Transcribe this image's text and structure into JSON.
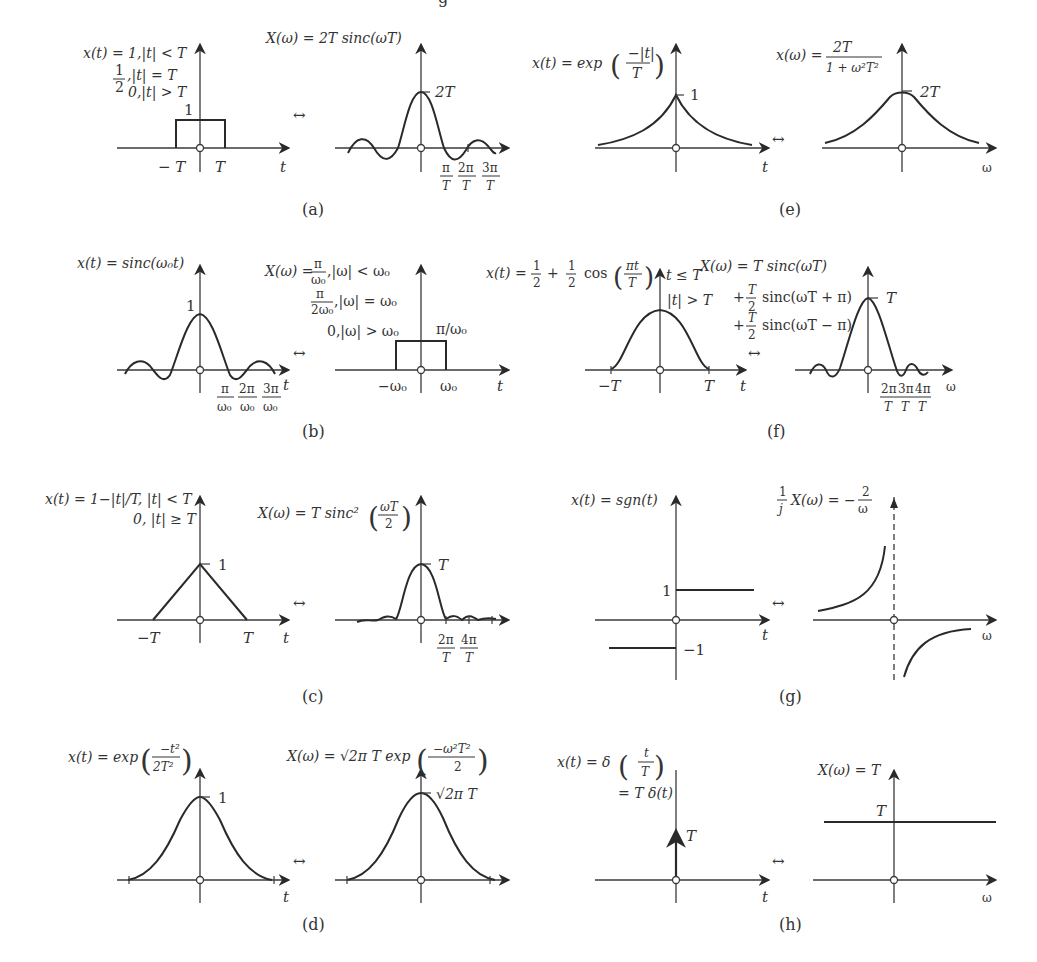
{
  "figure": {
    "cut_off_top_text": "g",
    "pair_symbol": "↔",
    "panels": {
      "a": {
        "caption": "(a)",
        "time": {
          "eq1": "x(t) = 1,|t| < T",
          "eq2_frac_num": "1",
          "eq2_frac_den": "2",
          "eq2": ",|t| = T",
          "eq3": "0,|t| > T",
          "height_label": "1",
          "ticks": [
            "− T",
            "T"
          ],
          "axis_label": "t"
        },
        "freq": {
          "eq1": "X(ω) = 2T sinc(ωT)",
          "peak_label": "2T",
          "ticks": [
            {
              "num": "π",
              "den": "T"
            },
            {
              "num": "2π",
              "den": "T"
            },
            {
              "num": "3π",
              "den": "T"
            }
          ]
        }
      },
      "b": {
        "caption": "(b)",
        "time": {
          "eq1": "x(t) = sinc(ω₀t)",
          "peak_label": "1",
          "ticks": [
            {
              "num": "π",
              "den": "ω₀"
            },
            {
              "num": "2π",
              "den": "ω₀"
            },
            {
              "num": "3π",
              "den": "ω₀"
            }
          ],
          "axis_label": "t"
        },
        "freq": {
          "eq1_prefix": "X(ω) =",
          "eq1_num": "π",
          "eq1_den": "ω₀",
          "eq1_suffix": ",|ω| < ω₀",
          "eq2_num": "π",
          "eq2_den": "2ω₀",
          "eq2_suffix": ",|ω| = ω₀",
          "eq3": "0,|ω| > ω₀",
          "height_label": "π/ω₀",
          "ticks": [
            "−ω₀",
            "ω₀"
          ],
          "axis_label": "t"
        }
      },
      "c": {
        "caption": "(c)",
        "time": {
          "eq1": "x(t) = 1−|t|/T, |t| < T",
          "eq2": "0, |t| ≥ T",
          "peak_label": "1",
          "ticks": [
            "−T",
            "T"
          ],
          "axis_label": "t"
        },
        "freq": {
          "eq1_prefix": "X(ω) = T sinc²",
          "eq1_num": "ωT",
          "eq1_den": "2",
          "peak_label": "T",
          "ticks": [
            {
              "num": "2π",
              "den": "T"
            },
            {
              "num": "4π",
              "den": "T"
            }
          ]
        }
      },
      "d": {
        "caption": "(d)",
        "time": {
          "eq1_prefix": "x(t) = exp",
          "eq1_num": "−t²",
          "eq1_den": "2T²",
          "peak_label": "1",
          "axis_label": "t"
        },
        "freq": {
          "eq1_prefix": "X(ω) = √2π T exp",
          "eq1_num": "−ω²T²",
          "eq1_den": "2",
          "peak_label": "√2π T"
        }
      },
      "e": {
        "caption": "(e)",
        "time": {
          "eq1_prefix": "x(t) = exp",
          "eq1_num": "−|t|",
          "eq1_den": "T",
          "peak_label": "1",
          "axis_label": "t"
        },
        "freq": {
          "eq1_prefix": "x(ω) =",
          "eq1_num": "2T",
          "eq1_den": "1 + ω²T²",
          "peak_label": "2T",
          "axis_label": "ω"
        }
      },
      "f": {
        "caption": "(f)",
        "time": {
          "eq1_prefix": "x(t) =",
          "eq1_a_num": "1",
          "eq1_a_den": "2",
          "eq1_plus": "+",
          "eq1_b_num": "1",
          "eq1_b_den": "2",
          "eq1_cos": "cos",
          "eq1_c_num": "πt",
          "eq1_c_den": "T",
          "cond1": "t ≤ T",
          "cond2": "|t| > T",
          "ticks": [
            "−T",
            "T"
          ],
          "axis_label": "t"
        },
        "freq": {
          "eq1": "X(ω) = T sinc(ωT)",
          "eq2_plus": "+",
          "eq2_num": "T",
          "eq2_den": "2",
          "eq2": "sinc(ωT + π)",
          "eq3_plus": "+",
          "eq3_num": "T",
          "eq3_den": "2",
          "eq3": "sinc(ωT − π)",
          "peak_label": "T",
          "ticks": [
            {
              "num": "2π",
              "den": "T"
            },
            {
              "num": "3π",
              "den": "T"
            },
            {
              "num": "4π",
              "den": "T"
            }
          ],
          "axis_label": "ω"
        }
      },
      "g": {
        "caption": "(g)",
        "time": {
          "eq1": "x(t) = sgn(t)",
          "pos_label": "1",
          "neg_label": "−1",
          "axis_label": "t"
        },
        "freq": {
          "eq1_a_num": "1",
          "eq1_a_den": "j",
          "eq1_mid": "X(ω) = −",
          "eq1_b_num": "2",
          "eq1_b_den": "ω",
          "axis_label": "ω"
        }
      },
      "h": {
        "caption": "(h)",
        "time": {
          "eq1_prefix": "x(t) = δ",
          "eq1_num": "t",
          "eq1_den": "T",
          "eq2": "= T δ(t)",
          "impulse_label": "T",
          "axis_label": "t"
        },
        "freq": {
          "eq1": "X(ω) = T",
          "level_label": "T",
          "axis_label": "ω"
        }
      }
    }
  }
}
